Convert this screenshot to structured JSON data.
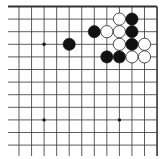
{
  "game": "go",
  "view": "top-right corner",
  "board": {
    "columns_visible": 12,
    "rows_visible": 12,
    "edges": [
      "top",
      "right"
    ],
    "line_color": "#333333",
    "background": "#ffffff"
  },
  "star_points": [
    {
      "col": 2,
      "row": 3
    },
    {
      "col": 2,
      "row": 9
    },
    {
      "col": 8,
      "row": 9
    }
  ],
  "stones": [
    {
      "color": "white",
      "col": 8,
      "row": 1
    },
    {
      "color": "black",
      "col": 9,
      "row": 1
    },
    {
      "color": "black",
      "col": 6,
      "row": 2
    },
    {
      "color": "white",
      "col": 7,
      "row": 2
    },
    {
      "color": "white",
      "col": 8,
      "row": 2
    },
    {
      "color": "black",
      "col": 9,
      "row": 2
    },
    {
      "color": "black",
      "col": 4,
      "row": 3
    },
    {
      "color": "white",
      "col": 8,
      "row": 3
    },
    {
      "color": "black",
      "col": 9,
      "row": 3
    },
    {
      "color": "white",
      "col": 10,
      "row": 3
    },
    {
      "color": "black",
      "col": 7,
      "row": 4
    },
    {
      "color": "black",
      "col": 8,
      "row": 4
    },
    {
      "color": "white",
      "col": 9,
      "row": 4
    },
    {
      "color": "white",
      "col": 10,
      "row": 4
    }
  ]
}
